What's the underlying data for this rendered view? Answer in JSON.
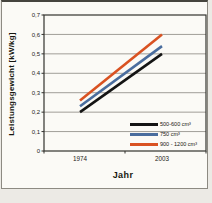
{
  "figure": {
    "y_axis_title": "Leistungsgewicht [kW/kg]",
    "x_axis_title": "Jahr"
  },
  "chart_data": {
    "type": "line",
    "x": [
      1974,
      2003
    ],
    "x_tick_labels": [
      "1974",
      "2003"
    ],
    "series": [
      {
        "name": "500-600 cm³",
        "values": [
          0.2,
          0.5
        ],
        "color": "#141414"
      },
      {
        "name": "750 cm³",
        "values": [
          0.23,
          0.54
        ],
        "color": "#4a6d9e"
      },
      {
        "name": "900 - 1200 cm³",
        "values": [
          0.26,
          0.6
        ],
        "color": "#d95222"
      }
    ],
    "title": "",
    "xlabel": "Jahr",
    "ylabel": "Leistungsgewicht [kW/kg]",
    "ylim": [
      0,
      0.7
    ],
    "y_ticks": [
      0,
      0.1,
      0.2,
      0.3,
      0.4,
      0.5,
      0.6,
      0.7
    ],
    "y_tick_labels": [
      "0",
      "0,1",
      "0,2",
      "0,3",
      "0,4",
      "0,5",
      "0,6",
      "0,7"
    ],
    "grid": "horizontal",
    "legend_position": "bottom-right-inside"
  },
  "colors": {
    "gridline": "#a09e98",
    "plot_border": "#33322e",
    "frame_border": "#8d8a82"
  }
}
